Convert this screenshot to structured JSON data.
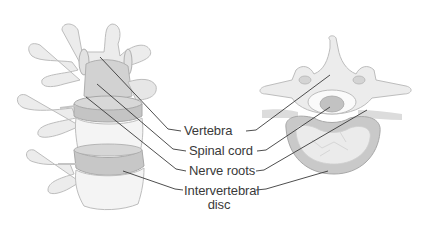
{
  "diagram": {
    "labels": [
      {
        "id": "vertebra",
        "text": "Vertebra"
      },
      {
        "id": "spinal-cord",
        "text": "Spinal cord"
      },
      {
        "id": "nerve-roots",
        "text": "Nerve roots"
      },
      {
        "id": "intervertebral-disc",
        "line1": "Intervertebral",
        "line2": "disc"
      }
    ],
    "views": [
      {
        "id": "lateral-view",
        "description": "Side view of lumbar vertebrae with discs"
      },
      {
        "id": "axial-view",
        "description": "Top-down cross-section of vertebra and disc"
      }
    ],
    "colors": {
      "bone_fill": "#ececec",
      "bone_stroke": "#b8b8b8",
      "disc_fill": "#c9c9c9",
      "disc_dark": "#a8a8a8",
      "cord_fill": "#bdbdbd",
      "leader_line": "#3a3a3a",
      "label_text": "#3a3a3a",
      "background": "#ffffff"
    }
  }
}
